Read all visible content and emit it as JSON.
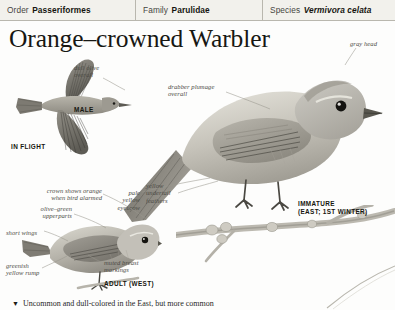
{
  "taxonomy": {
    "order_key": "Order",
    "order_value": "Passeriformes",
    "family_key": "Family",
    "family_value": "Parulidae",
    "species_key": "Species",
    "species_value": "Vermivora celata"
  },
  "page": {
    "title": "Orange–crowned Warbler",
    "body_text": "Uncommon and dull-colored in the East, but more common"
  },
  "annotations": {
    "dull_olive": "dull olive\noverall",
    "drabber_plumage": "drabber plumage\noverall",
    "gray_head": "gray head",
    "pale_eyebrow": "pale\nyellow\neyebrow",
    "yellow_undertail": "yellow\nundertail\nfeathers",
    "crown_orange": "crown shows orange\nwhen bird alarmed",
    "olive_green": "olive–green\nupperparts",
    "short_wings": "short wings",
    "greenish_rump": "greenish\nyellow rump",
    "muted_breast": "muted breast\nmarkings"
  },
  "plate_labels": {
    "male": "MALE",
    "in_flight": "IN FLIGHT",
    "immature": "IMMATURE\n(EAST; 1ST WINTER)",
    "adult_west": "ADULT (WEST)"
  },
  "colors": {
    "header_bg": "#f2f1ec",
    "header_rule": "#b9b7ae",
    "title_ink": "#171713",
    "anno_ink": "#4c4b45",
    "caps_ink": "#16160f",
    "plumage_light": "#d9d7cf",
    "plumage_mid": "#a9a69c",
    "plumage_dark": "#6e6b62",
    "branch": "#bdbab1"
  }
}
